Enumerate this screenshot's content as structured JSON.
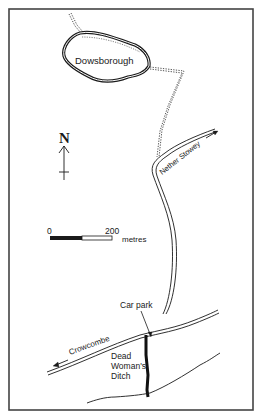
{
  "map": {
    "labels": {
      "hillfort": "Dowsborough",
      "north": "N",
      "nether_stowey": "Nether Stowey",
      "car_park": "Car park",
      "crowcombe": "Crowcombe",
      "ditch_line1": "Dead",
      "ditch_line2": "Woman's",
      "ditch_line3": "Ditch"
    },
    "scale_bar": {
      "start": "0",
      "end": "200",
      "unit": "metres"
    },
    "colors": {
      "ink": "#1a1a1a",
      "paper": "#ffffff",
      "frame": "#444444"
    }
  }
}
